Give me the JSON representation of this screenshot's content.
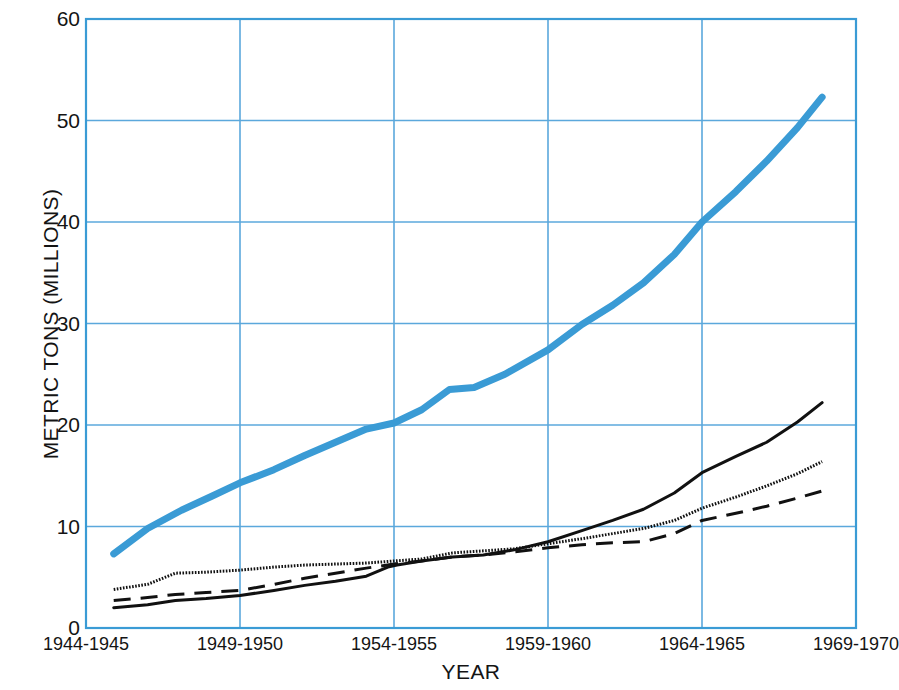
{
  "chart_data": {
    "type": "line",
    "title": "",
    "xlabel": "YEAR",
    "ylabel": "METRIC TONS (MILLIONS)",
    "xlim": [
      1944.5,
      1969.5
    ],
    "ylim": [
      0,
      60
    ],
    "grid": true,
    "legend_position": "none",
    "colors": {
      "accent_blue": "#3A9BD5",
      "series_black": "#111111",
      "grid_blue": "#5BA8DC",
      "axis_blue": "#3A9BD5",
      "text": "#141414",
      "background": "#FFFFFF"
    },
    "y_ticks": [
      0,
      10,
      20,
      30,
      40,
      50,
      60
    ],
    "y_tick_labels": [
      "0",
      "10",
      "20",
      "30",
      "40",
      "50",
      "60"
    ],
    "x_ticks": [
      1944.5,
      1949.5,
      1954.5,
      1959.5,
      1964.5,
      1969.5
    ],
    "x_tick_labels": [
      "1944-1945",
      "1949-1950",
      "1954-1955",
      "1959-1960",
      "1964-1965",
      "1969-1970"
    ],
    "series": [
      {
        "name": "series-1-thick-blue",
        "style": "solid",
        "color": "#3A9BD5",
        "width": 7,
        "x": [
          1945.4,
          1946.5,
          1947.6,
          1948.6,
          1949.5,
          1950.6,
          1951.6,
          1952.6,
          1953.6,
          1954.5,
          1955.4,
          1956.3,
          1957.1,
          1958.1,
          1959.5,
          1960.6,
          1961.6,
          1962.6,
          1963.6,
          1964.5,
          1965.6,
          1966.6,
          1967.6,
          1968.4
        ],
        "y": [
          7.3,
          9.8,
          11.6,
          13.0,
          14.3,
          15.6,
          17.0,
          18.3,
          19.6,
          20.2,
          21.5,
          23.5,
          23.7,
          25.0,
          27.4,
          29.9,
          31.8,
          34.0,
          36.8,
          40.0,
          43.0,
          46.0,
          49.3,
          52.3
        ]
      },
      {
        "name": "series-2-dotted-black",
        "style": "dotted",
        "color": "#111111",
        "width": 3,
        "x": [
          1945.4,
          1946.5,
          1947.4,
          1948.4,
          1949.5,
          1950.6,
          1951.6,
          1952.6,
          1953.6,
          1954.5,
          1955.4,
          1956.4,
          1957.4,
          1958.4,
          1959.5,
          1960.6,
          1961.6,
          1962.6,
          1963.6,
          1964.5,
          1965.6,
          1966.6,
          1967.6,
          1968.4
        ],
        "y": [
          3.8,
          4.3,
          5.4,
          5.5,
          5.7,
          6.0,
          6.2,
          6.3,
          6.4,
          6.6,
          6.8,
          7.4,
          7.6,
          7.8,
          8.3,
          8.8,
          9.3,
          9.8,
          10.6,
          11.8,
          12.9,
          14.0,
          15.2,
          16.4
        ]
      },
      {
        "name": "series-3-solid-black",
        "style": "solid",
        "color": "#111111",
        "width": 3,
        "x": [
          1945.4,
          1946.5,
          1947.4,
          1948.4,
          1949.5,
          1950.6,
          1951.6,
          1952.6,
          1953.6,
          1954.3,
          1954.6,
          1955.4,
          1956.4,
          1957.4,
          1958.4,
          1959.5,
          1960.6,
          1961.6,
          1962.6,
          1963.6,
          1964.5,
          1965.6,
          1966.6,
          1967.6,
          1968.4
        ],
        "y": [
          2.0,
          2.3,
          2.7,
          2.9,
          3.2,
          3.7,
          4.2,
          4.6,
          5.1,
          6.0,
          6.2,
          6.6,
          7.0,
          7.2,
          7.7,
          8.5,
          9.6,
          10.6,
          11.7,
          13.3,
          15.3,
          16.9,
          18.3,
          20.3,
          22.2
        ]
      },
      {
        "name": "series-4-dashed-black",
        "style": "dashed",
        "color": "#111111",
        "width": 3,
        "x": [
          1945.4,
          1946.5,
          1947.4,
          1948.4,
          1949.5,
          1950.6,
          1951.6,
          1952.6,
          1953.6,
          1954.5,
          1955.4,
          1956.4,
          1957.4,
          1958.4,
          1959.5,
          1960.6,
          1961.6,
          1962.6,
          1963.6,
          1964.5,
          1965.6,
          1966.6,
          1967.6,
          1968.4
        ],
        "y": [
          2.7,
          3.0,
          3.3,
          3.5,
          3.7,
          4.3,
          4.9,
          5.4,
          5.9,
          6.3,
          6.6,
          7.0,
          7.2,
          7.5,
          7.9,
          8.2,
          8.4,
          8.5,
          9.3,
          10.6,
          11.3,
          12.0,
          12.8,
          13.5
        ]
      }
    ]
  }
}
